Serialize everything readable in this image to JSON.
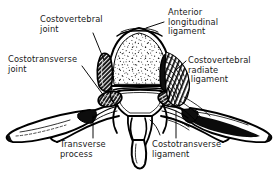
{
  "figure": {
    "view": "superior (axial) view",
    "background_color": "#ffffff",
    "ink_color": "#000000",
    "text_color": "#1a1a1a",
    "style": "black-and-white anatomical line drawing with stipple and hatching"
  },
  "labels": {
    "costovertebral_joint": "Costovertebral\njoint",
    "anterior_longitudinal_ligament": "Anterior\nlongitudinal\nligament",
    "costotransverse_joint": "Costotransverse\njoint",
    "costovertebral_radiate_ligament": "Costovertebral\nradiate\n ligament",
    "transverse_process": "Transverse\nprocess",
    "costotransverse_ligament": "Costotransverse\nligament"
  },
  "structures": [
    {
      "name": "vertebral-body",
      "description": "rounded dome, stippled cancellous interior"
    },
    {
      "name": "vertebral-foramen",
      "description": "central arch opening"
    },
    {
      "name": "spinous-process",
      "description": "narrow tapering midline projection, inferior"
    },
    {
      "name": "left-transverse-process",
      "description": "lateral wing, left"
    },
    {
      "name": "right-transverse-process",
      "description": "lateral wing, right"
    },
    {
      "name": "left-rib",
      "description": "elongated tapering rib head and neck, left"
    },
    {
      "name": "right-rib",
      "description": "elongated rib head and neck with heavy black shading, right"
    },
    {
      "name": "left-costal-facet",
      "description": "dark oval articular facet, left"
    },
    {
      "name": "right-costal-facet",
      "description": "dark oval articular facet, right"
    },
    {
      "name": "radiate-ligament-hatching",
      "description": "fan-shaped dense hatching over right costovertebral joint"
    }
  ]
}
